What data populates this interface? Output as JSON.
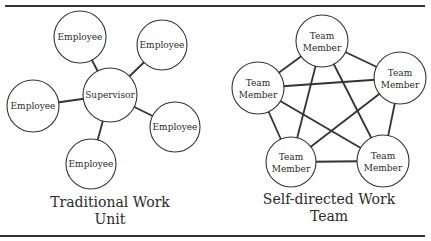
{
  "colors": {
    "stroke": "#333333",
    "text": "#2a2a2a",
    "background": "#ffffff"
  },
  "left_diagram": {
    "caption_line1": "Traditional Work",
    "caption_line2": "Unit",
    "center": {
      "label": "Supervisor",
      "x": 110,
      "y": 95,
      "r": 27
    },
    "nodes": [
      {
        "label": "Employee",
        "x": 80,
        "y": 37,
        "r": 26
      },
      {
        "label": "Employee",
        "x": 162,
        "y": 45,
        "r": 25
      },
      {
        "label": "Employee",
        "x": 33,
        "y": 106,
        "r": 26
      },
      {
        "label": "Employee",
        "x": 175,
        "y": 127,
        "r": 25
      },
      {
        "label": "Employee",
        "x": 91,
        "y": 164,
        "r": 25
      }
    ]
  },
  "right_diagram": {
    "caption_line1": "Self-directed Work",
    "caption_line2": "Team",
    "nodes": [
      {
        "label1": "Team",
        "label2": "Member",
        "x": 322,
        "y": 41,
        "r": 26
      },
      {
        "label1": "Team",
        "label2": "Member",
        "x": 400,
        "y": 78,
        "r": 26
      },
      {
        "label1": "Team",
        "label2": "Member",
        "x": 383,
        "y": 161,
        "r": 26
      },
      {
        "label1": "Team",
        "label2": "Member",
        "x": 291,
        "y": 162,
        "r": 25
      },
      {
        "label1": "Team",
        "label2": "Member",
        "x": 258,
        "y": 88,
        "r": 26
      }
    ]
  }
}
